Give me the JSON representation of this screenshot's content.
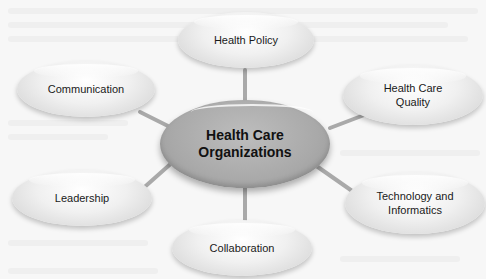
{
  "diagram": {
    "type": "hub-and-spoke",
    "center": {
      "label_line1": "Health Care",
      "label_line2": "Organizations"
    },
    "nodes": [
      {
        "id": "health-policy",
        "label_line1": "Health Policy",
        "label_line2": ""
      },
      {
        "id": "health-care-quality",
        "label_line1": "Health Care",
        "label_line2": "Quality"
      },
      {
        "id": "technology-informatics",
        "label_line1": "Technology and",
        "label_line2": "Informatics"
      },
      {
        "id": "collaboration",
        "label_line1": "Collaboration",
        "label_line2": ""
      },
      {
        "id": "leadership",
        "label_line1": "Leadership",
        "label_line2": ""
      },
      {
        "id": "communication",
        "label_line1": "Communication",
        "label_line2": ""
      }
    ],
    "colors": {
      "center_fill": "#a9a9a9",
      "node_fill": "#e8e8e8",
      "connector": "#9a9a9a",
      "background": "#f7f7f7"
    }
  }
}
